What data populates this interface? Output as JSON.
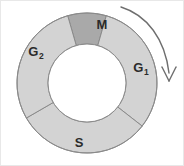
{
  "figure": {
    "background_color": "#ffffff",
    "border_color": "#e8e8e8",
    "width": 184,
    "height": 166
  },
  "ring": {
    "center_x": 86,
    "center_y": 82,
    "outer_radius": 70,
    "inner_radius": 39,
    "stroke_color": "#8a8a8a",
    "stroke_width": 1,
    "inner_fill": "#ffffff"
  },
  "segments": [
    {
      "id": "m-phase",
      "label": "M",
      "subscript": "",
      "fill": "#a9a9a9",
      "start_angle_deg": -16,
      "end_angle_deg": 16,
      "label_x": 101,
      "label_y": 25
    },
    {
      "id": "g1-phase",
      "label": "G",
      "subscript": "1",
      "fill": "#d3d3d3",
      "start_angle_deg": 16,
      "end_angle_deg": 128,
      "label_x": 140,
      "label_y": 68
    },
    {
      "id": "s-phase",
      "label": "S",
      "subscript": "",
      "fill": "#d3d3d3",
      "start_angle_deg": 128,
      "end_angle_deg": 240,
      "label_x": 78,
      "label_y": 143
    },
    {
      "id": "g2-phase",
      "label": "G",
      "subscript": "2",
      "fill": "#d3d3d3",
      "start_angle_deg": 240,
      "end_angle_deg": 344,
      "label_x": 35,
      "label_y": 52
    }
  ],
  "direction_arrow": {
    "name": "clockwise-direction-arrow",
    "color": "#6e6e6e",
    "stroke_width": 1.4,
    "path": "M 120 6 C 146 14 164 38 168 72",
    "head_left": "M 161 66 L 168 80",
    "head_right": "M 175 66 L 168 80"
  }
}
